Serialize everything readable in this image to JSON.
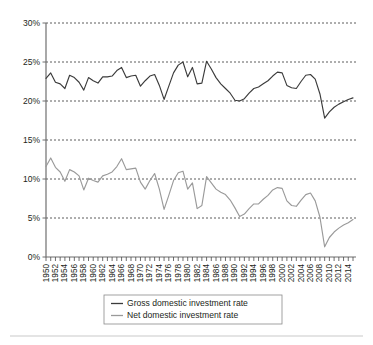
{
  "chart_data": {
    "type": "line",
    "title": "",
    "subtitle": "",
    "xlabel": "",
    "ylabel": "",
    "grid": true,
    "legend_position": "bottom",
    "ylim": [
      0,
      30
    ],
    "yticks": [
      0,
      5,
      10,
      15,
      20,
      25,
      30
    ],
    "ytick_labels": [
      "0%",
      "5%",
      "10%",
      "15%",
      "20%",
      "25%",
      "30%"
    ],
    "xlim": [
      1950,
      2015
    ],
    "xtick_labels": [
      "1950",
      "1952",
      "1954",
      "1956",
      "1958",
      "1960",
      "1962",
      "1964",
      "1966",
      "1968",
      "1970",
      "1972",
      "1974",
      "1976",
      "1978",
      "1980",
      "1982",
      "1984",
      "1986",
      "1988",
      "1990",
      "1992",
      "1994",
      "1996",
      "1998",
      "2000",
      "2002",
      "2004",
      "2006",
      "2008",
      "2010",
      "2012",
      "2014"
    ],
    "x": [
      1950,
      1951,
      1952,
      1953,
      1954,
      1955,
      1956,
      1957,
      1958,
      1959,
      1960,
      1961,
      1962,
      1963,
      1964,
      1965,
      1966,
      1967,
      1968,
      1969,
      1970,
      1971,
      1972,
      1973,
      1974,
      1975,
      1976,
      1977,
      1978,
      1979,
      1980,
      1981,
      1982,
      1983,
      1984,
      1985,
      1986,
      1987,
      1988,
      1989,
      1990,
      1991,
      1992,
      1993,
      1994,
      1995,
      1996,
      1997,
      1998,
      1999,
      2000,
      2001,
      2002,
      2003,
      2004,
      2005,
      2006,
      2007,
      2008,
      2009,
      2010,
      2011,
      2012,
      2013,
      2014,
      2015
    ],
    "series": [
      {
        "name": "Gross domestic investment rate",
        "color": "#3b3b3b",
        "values": [
          22.9,
          23.6,
          22.4,
          22.2,
          21.6,
          23.3,
          23.0,
          22.4,
          21.4,
          23.0,
          22.6,
          22.3,
          23.1,
          23.1,
          23.2,
          23.9,
          24.3,
          23.0,
          23.2,
          23.3,
          21.9,
          22.6,
          23.2,
          23.4,
          22.0,
          20.2,
          21.9,
          23.6,
          24.6,
          25.0,
          23.1,
          24.3,
          22.2,
          22.3,
          25.1,
          24.1,
          23.0,
          22.2,
          21.6,
          21.0,
          20.1,
          20.0,
          20.3,
          21.0,
          21.6,
          21.8,
          22.2,
          22.6,
          23.2,
          23.7,
          23.6,
          22.0,
          21.7,
          21.6,
          22.5,
          23.3,
          23.4,
          22.8,
          20.9,
          17.8,
          18.6,
          19.2,
          19.6,
          19.9,
          20.2,
          20.4
        ]
      },
      {
        "name": "Net domestic investment rate",
        "color": "#9a9a9a",
        "values": [
          11.6,
          12.7,
          11.5,
          10.9,
          9.7,
          11.2,
          10.9,
          10.4,
          8.6,
          10.1,
          9.8,
          9.6,
          10.4,
          10.6,
          10.9,
          11.6,
          12.6,
          11.2,
          11.3,
          11.4,
          9.6,
          8.7,
          9.8,
          10.7,
          8.7,
          6.1,
          7.9,
          9.8,
          10.8,
          11.0,
          8.7,
          9.5,
          6.2,
          6.6,
          10.3,
          9.5,
          8.7,
          8.3,
          8.0,
          7.3,
          6.3,
          5.2,
          5.5,
          6.2,
          6.8,
          6.8,
          7.4,
          7.9,
          8.6,
          8.9,
          8.8,
          7.2,
          6.6,
          6.5,
          7.3,
          8.0,
          8.2,
          7.2,
          5.1,
          1.3,
          2.5,
          3.2,
          3.7,
          4.1,
          4.4,
          4.8
        ]
      }
    ]
  },
  "legend": {
    "items": [
      {
        "label": "Gross domestic investment rate"
      },
      {
        "label": "Net domestic investment rate"
      }
    ]
  }
}
